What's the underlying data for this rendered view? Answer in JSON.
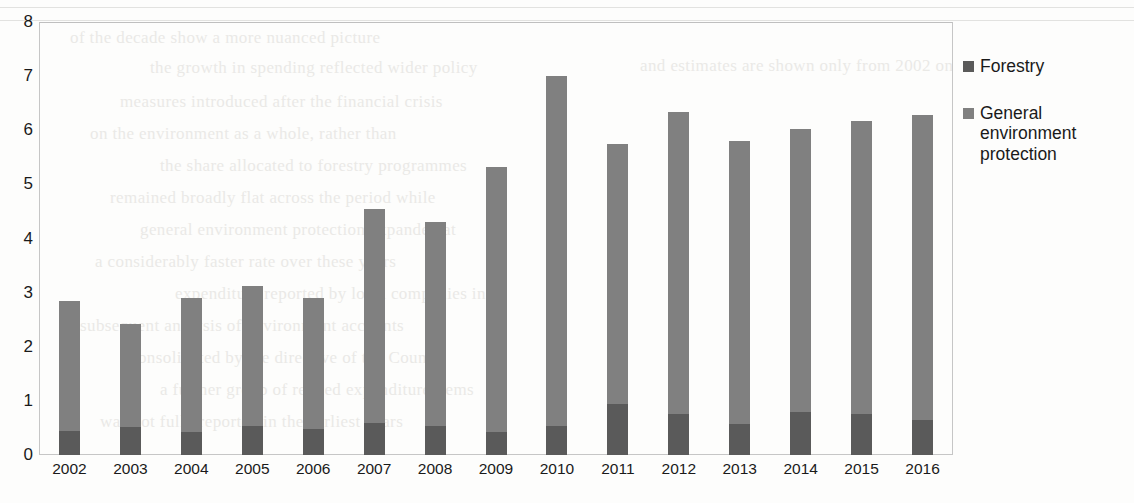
{
  "chart_data": {
    "type": "bar",
    "subtype": "stacked-column",
    "title": "",
    "subtitle": "",
    "xlabel": "",
    "ylabel": "",
    "ylim": [
      0,
      8
    ],
    "ytick_labels": [
      "0",
      "1",
      "2",
      "3",
      "4",
      "5",
      "6",
      "7",
      "8"
    ],
    "yticks": [
      0,
      1,
      2,
      3,
      4,
      5,
      6,
      7,
      8
    ],
    "grid": false,
    "legend_position": "right",
    "categories": [
      "2002",
      "2003",
      "2004",
      "2005",
      "2006",
      "2007",
      "2008",
      "2009",
      "2010",
      "2011",
      "2012",
      "2013",
      "2014",
      "2015",
      "2016"
    ],
    "series": [
      {
        "name": "Forestry",
        "color": "#5a5a5a",
        "values": [
          0.44,
          0.52,
          0.42,
          0.53,
          0.48,
          0.6,
          0.54,
          0.42,
          0.53,
          0.95,
          0.76,
          0.58,
          0.8,
          0.76,
          0.64
        ]
      },
      {
        "name": "General environment protection",
        "color": "#808080",
        "values": [
          2.41,
          1.9,
          2.48,
          2.6,
          2.42,
          3.95,
          3.76,
          4.91,
          6.47,
          4.79,
          5.57,
          5.22,
          5.22,
          5.41,
          5.64
        ]
      }
    ],
    "totals": [
      2.85,
      2.42,
      2.9,
      3.13,
      2.9,
      4.55,
      4.3,
      5.33,
      7.0,
      5.74,
      6.33,
      5.8,
      6.02,
      6.17,
      6.28
    ]
  },
  "legend": {
    "items": [
      {
        "label": "Forestry",
        "color": "#5a5a5a"
      },
      {
        "label": "General environment protection",
        "color": "#808080"
      }
    ]
  },
  "page_artifacts": {
    "bleed_lines": 2,
    "faint_text": [
      "of the decade show a more nuanced picture",
      "the growth in spending reflected wider policy",
      "measures introduced after the financial crisis",
      "on the environment as a whole, rather than",
      "the share allocated to forestry programmes",
      "remained broadly flat across the period while",
      "general environment protection expanded at",
      "a considerably faster rate over these years",
      "expenditure reported by local companies in",
      "subsequent analysis of environment accounts",
      "consolidated by the directive of the Council",
      "a further group of related expenditure items",
      "was not fully reported in the earliest years",
      "and estimates are shown only from 2002 on"
    ]
  }
}
